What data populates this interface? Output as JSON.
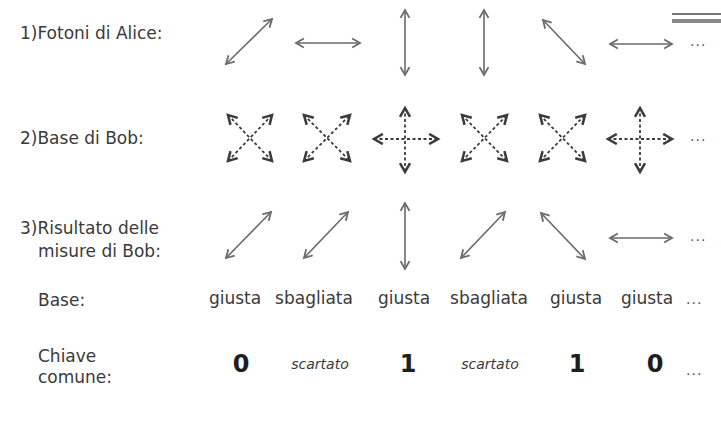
{
  "rows": {
    "alice": {
      "label": "1)Fotoni di Alice:",
      "polarizations": [
        "diagonal-45",
        "horizontal",
        "vertical",
        "vertical",
        "diagonal-135",
        "horizontal"
      ],
      "ellipsis": "..."
    },
    "bob_basis": {
      "label": "2)Base di Bob:",
      "bases": [
        "diagonal",
        "diagonal",
        "rectilinear",
        "diagonal",
        "diagonal",
        "rectilinear"
      ],
      "ellipsis": "..."
    },
    "bob_results": {
      "label_line1": "3)Risultato delle",
      "label_line2": "misure di Bob:",
      "polarizations": [
        "diagonal-45",
        "diagonal-45",
        "vertical",
        "diagonal-45",
        "diagonal-135",
        "horizontal"
      ],
      "ellipsis": "..."
    },
    "basis_check": {
      "label": "Base:",
      "values": [
        "giusta",
        "sbagliata",
        "giusta",
        "sbagliata",
        "giusta",
        "giusta"
      ],
      "ellipsis": "..."
    },
    "shared_key": {
      "label_line1": "Chiave",
      "label_line2": "comune:",
      "values": [
        "0",
        "scartato",
        "1",
        "scartato",
        "1",
        "0"
      ],
      "ellipsis": "..."
    }
  },
  "colors": {
    "arrow": "#6a6a6a",
    "dashed_arrow": "#3c3c3c",
    "text": "#3a3a3a",
    "bit": "#1e1e1e"
  }
}
